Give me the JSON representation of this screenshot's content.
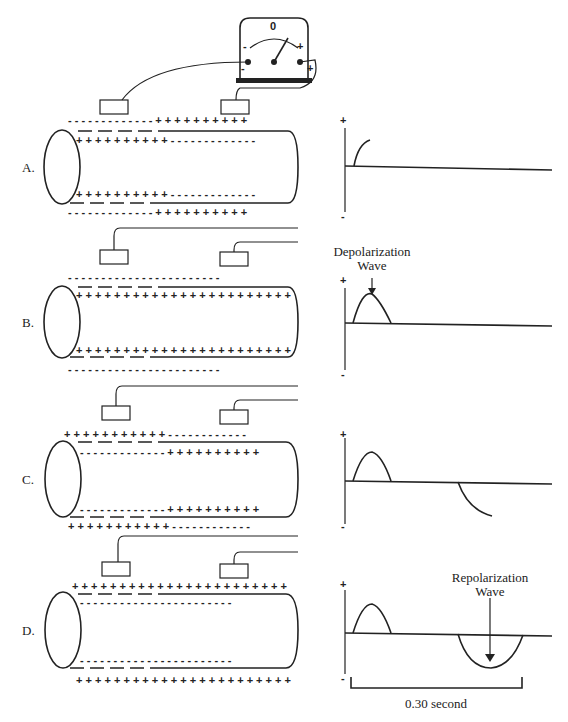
{
  "galvanometer": {
    "zero_label": "0",
    "minus_label": "-",
    "plus_label": "+",
    "terminal_minus": "-",
    "terminal_plus": "+"
  },
  "panels": [
    {
      "label": "A.",
      "stage": "Resting then beginning depolarization",
      "outer_top": "- - - - - - - - - - - - - + + + + + + + + + +",
      "inner_top": "+ + + + + + + + + + - - - - - - - - - - - - -",
      "inner_bottom": "+ + + + + + + + + + - - - - - - - - - - - - -",
      "outer_bottom": "- - - - - - - - - - - - - + + + + + + + + + +",
      "trace_plus": "+",
      "trace_minus": "-",
      "annotation": ""
    },
    {
      "label": "B.",
      "stage": "Fully depolarized",
      "outer_top": "- - - - - - - - - - - - - - - - - - - - - - -",
      "inner_top": "+ + + + + + + + + + + + + + + + + + + + + + +",
      "inner_bottom": "+ + + + + + + + + + + + + + + + + + + + + + +",
      "outer_bottom": "- - - - - - - - - - - - - - - - - - - - - - -",
      "trace_plus": "+",
      "trace_minus": "-",
      "annotation": "Depolarization",
      "annotation_line2": "Wave"
    },
    {
      "label": "C.",
      "stage": "Beginning repolarization",
      "outer_top": "+ + + + + + + + + + + - - - - - - - - - - - -",
      "inner_top": "- - - - - - - - - - - - - + + + + + + + + + +",
      "inner_bottom": "- - - - - - - - - - - - - + + + + + + + + + +",
      "outer_bottom": "+ + + + + + + + + + + - - - - - - - - - - - -",
      "trace_plus": "+",
      "trace_minus": "-",
      "annotation": ""
    },
    {
      "label": "D.",
      "stage": "Fully repolarized",
      "outer_top": "+ + + + + + + + + + + + + + + + + + + + + + +",
      "inner_top": "- - - - - - - - - - - - - - - - - - - - - - -",
      "inner_bottom": "- - - - - - - - - - - - - - - - - - - - - - -",
      "outer_bottom": "+ + + + + + + + + + + + + + + + + + + + + + +",
      "trace_plus": "+",
      "trace_minus": "-",
      "annotation": "Repolarization",
      "annotation_line2": "Wave"
    }
  ],
  "time_scale": {
    "label": "0.30 second"
  }
}
